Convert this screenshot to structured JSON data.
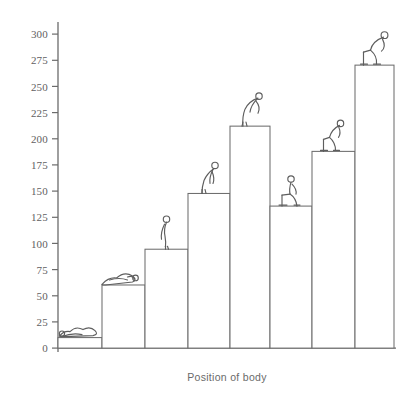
{
  "chart_data": {
    "type": "bar",
    "title": "",
    "xlabel": "Position of body",
    "ylabel": "",
    "categories": [
      "lying supine",
      "lying prone / reclining",
      "standing",
      "bending forward",
      "bending deep forward",
      "sitting",
      "sitting bent forward",
      "sitting deep bent forward"
    ],
    "values": [
      10,
      60,
      94,
      147,
      211,
      135,
      187,
      269
    ],
    "ylim": [
      0,
      310
    ],
    "yticks": [
      0,
      25,
      50,
      75,
      100,
      125,
      150,
      175,
      200,
      225,
      250,
      275,
      300
    ],
    "ytick_labels": [
      "0",
      "25",
      "50",
      "75",
      "100",
      "125",
      "150",
      "175",
      "200",
      "225",
      "250",
      "275",
      "300"
    ],
    "grid": false,
    "legend": false,
    "xtick_labels": [
      "",
      "",
      "",
      "",
      "",
      "",
      "",
      ""
    ]
  },
  "axis": {
    "y_tick_labels": [
      "300",
      "275",
      "250",
      "225",
      "200",
      "175",
      "150",
      "125",
      "100",
      "75",
      "50",
      "25",
      "0"
    ]
  },
  "caption": {
    "text": "Position of body"
  },
  "figures": {
    "names": [
      "person-lying-supine-icon",
      "person-lying-prone-icon",
      "person-standing-icon",
      "person-bending-forward-icon",
      "person-bending-deep-icon",
      "person-sitting-icon",
      "person-sitting-bent-icon",
      "person-sitting-deep-bent-icon"
    ]
  },
  "colors": {
    "background": "#ffffff",
    "ink": "#5e5e5e",
    "axis": "#6b6b6b",
    "bar_fill": "#ffffff",
    "bar_stroke": "#6e6e6e"
  }
}
